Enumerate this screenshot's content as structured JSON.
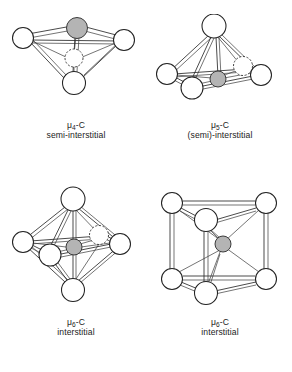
{
  "figure": {
    "background_color": "#ffffff",
    "line_color": "#2b2b2b",
    "vertex_fill": "#ffffff",
    "carbide_fill": "#b4b4b4",
    "panels": [
      {
        "id": "mu4",
        "caption_line1": "μ4-C",
        "caption_symbol": "μ",
        "caption_subscript": "4",
        "caption_suffix": "-C",
        "caption_line2": "semi-interstitial",
        "geometry": "tetrahedron",
        "metal_count": 4
      },
      {
        "id": "mu5",
        "caption_line1": "μ5-C",
        "caption_symbol": "μ",
        "caption_subscript": "5",
        "caption_suffix": "-C",
        "caption_line2": "(semi)-interstitial",
        "geometry": "square-pyramid",
        "metal_count": 5
      },
      {
        "id": "mu6-oct",
        "caption_line1": "μ6-C",
        "caption_symbol": "μ",
        "caption_subscript": "6",
        "caption_suffix": "-C",
        "caption_line2": "interstitial",
        "geometry": "octahedron",
        "metal_count": 6
      },
      {
        "id": "mu6-prism",
        "caption_line1": "μ6-C",
        "caption_symbol": "μ",
        "caption_subscript": "6",
        "caption_suffix": "-C",
        "caption_line2": "interstitial",
        "geometry": "trigonal-prism",
        "metal_count": 6
      }
    ]
  }
}
